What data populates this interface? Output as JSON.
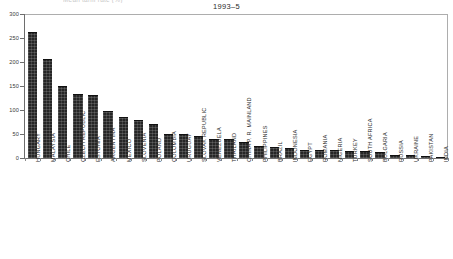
{
  "figure": {
    "title": "1993–5",
    "top_fragment": "Mean tariff rate (%)"
  },
  "axis": {
    "y_ticks": [
      "0",
      "50",
      "100",
      "150",
      "200",
      "250",
      "300"
    ],
    "y_min": 0,
    "y_max": 300
  },
  "chart_data": {
    "type": "bar",
    "title": "1993–5",
    "xlabel": "",
    "ylabel": "",
    "ylim": [
      0,
      300
    ],
    "yticks": [
      0,
      50,
      100,
      150,
      200,
      250,
      300
    ],
    "grid": false,
    "legend": null,
    "bar_color": "#262626",
    "categories": [
      "HUNGARY",
      "MALAYSIA",
      "CHILE",
      "CZECH REPUBLIC",
      "ESTONIA",
      "ARGENTINA",
      "MEXICO",
      "SLOVENIA",
      "POLAND",
      "COLOMBIA",
      "URUGUAY",
      "SLOVAK REPUBLIC",
      "VENEZUELA",
      "THAILAND",
      "CHINA P. R. MAINLAND",
      "PHILIPPINES",
      "BRAZIL",
      "INDONESIA",
      "EGYPT",
      "ROMANIA",
      "NIGERIA",
      "TURKEY",
      "SOUTH AFRICA",
      "BULGARIA",
      "RUSSIA",
      "UKRAINE",
      "PAKISTAN",
      "INDIA"
    ],
    "values": [
      263,
      207,
      151,
      133,
      132,
      98,
      86,
      79,
      70,
      51,
      50,
      45,
      40,
      39,
      33,
      24,
      23,
      21,
      17,
      17,
      16,
      15,
      14,
      13,
      7,
      6,
      4,
      3
    ]
  }
}
